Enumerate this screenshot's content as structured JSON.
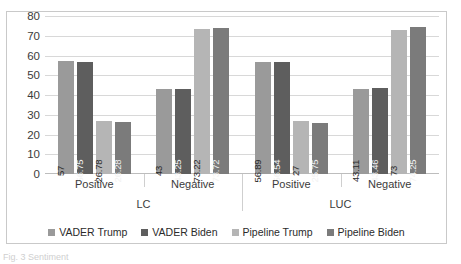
{
  "chart_data": {
    "type": "bar",
    "title": "",
    "xlabel": "",
    "ylabel": "",
    "ylim": [
      0,
      80
    ],
    "yticks": [
      80,
      70,
      60,
      50,
      40,
      30,
      20,
      10,
      0
    ],
    "grid": true,
    "legend_position": "bottom",
    "categories": [
      "Positive",
      "Negative",
      "Positive",
      "Negative"
    ],
    "group_labels": [
      "LC",
      "LUC"
    ],
    "series": [
      {
        "name": "VADER Trump",
        "color": "#9a9a9a",
        "values": [
          57,
          43,
          56.89,
          43.11
        ],
        "labels": [
          "57",
          "43",
          "56.89",
          "43.11"
        ]
      },
      {
        "name": "VADER Biden",
        "color": "#5e5e5e",
        "values": [
          56.75,
          43.25,
          56.54,
          43.46
        ],
        "labels": [
          "56.75",
          "43.25",
          "56.54",
          "43.46"
        ]
      },
      {
        "name": "Pipeline Trump",
        "color": "#b5b5b5",
        "values": [
          26.78,
          73.22,
          27,
          73
        ],
        "labels": [
          "26.78",
          "73.22",
          "27",
          "73"
        ]
      },
      {
        "name": "Pipeline Biden",
        "color": "#7b7b7b",
        "values": [
          26.28,
          73.72,
          25.75,
          74.25
        ],
        "labels": [
          "26.28",
          "73.72",
          "25.75",
          "74.25"
        ]
      }
    ]
  },
  "caption": {
    "text": "Fig. 3  Sentiment"
  },
  "colors": {
    "frame": "#c9c9c9",
    "gridline": "#d8d8d8",
    "text": "#3b3b3b"
  }
}
